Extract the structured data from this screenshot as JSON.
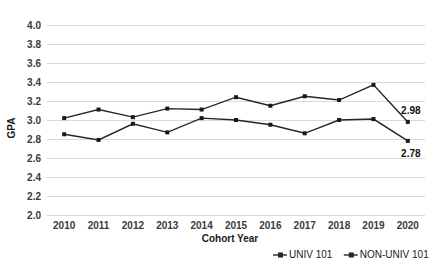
{
  "chart_data": {
    "type": "line",
    "title": "",
    "xlabel": "Cohort Year",
    "ylabel": "GPA",
    "categories": [
      "2010",
      "2011",
      "2012",
      "2013",
      "2014",
      "2015",
      "2016",
      "2017",
      "2018",
      "2019",
      "2020"
    ],
    "ylim": [
      2.0,
      4.0
    ],
    "ytick_step": 0.2,
    "yticks": [
      "4.0",
      "3.8",
      "3.6",
      "3.4",
      "3.2",
      "3.0",
      "2.8",
      "2.6",
      "2.4",
      "2.2",
      "2.0"
    ],
    "grid": "horizontal",
    "legend_position": "bottom-right",
    "series": [
      {
        "name": "UNIV 101",
        "color": "#262626",
        "marker": "square",
        "values": [
          3.02,
          3.11,
          3.03,
          3.12,
          3.11,
          3.24,
          3.15,
          3.25,
          3.21,
          3.37,
          2.98
        ],
        "end_label": "2.98"
      },
      {
        "name": "NON-UNIV 101",
        "color": "#262626",
        "marker": "square",
        "values": [
          2.85,
          2.79,
          2.96,
          2.87,
          3.02,
          3.0,
          2.95,
          2.86,
          3.0,
          3.01,
          2.78
        ],
        "end_label": "2.78"
      }
    ],
    "annotations": [
      {
        "text": "2.98",
        "series": "UNIV 101",
        "at_category": "2020"
      },
      {
        "text": "2.78",
        "series": "NON-UNIV 101",
        "at_category": "2020"
      }
    ]
  },
  "legend": {
    "items": [
      {
        "label": "UNIV 101"
      },
      {
        "label": "NON-UNIV 101"
      }
    ]
  }
}
